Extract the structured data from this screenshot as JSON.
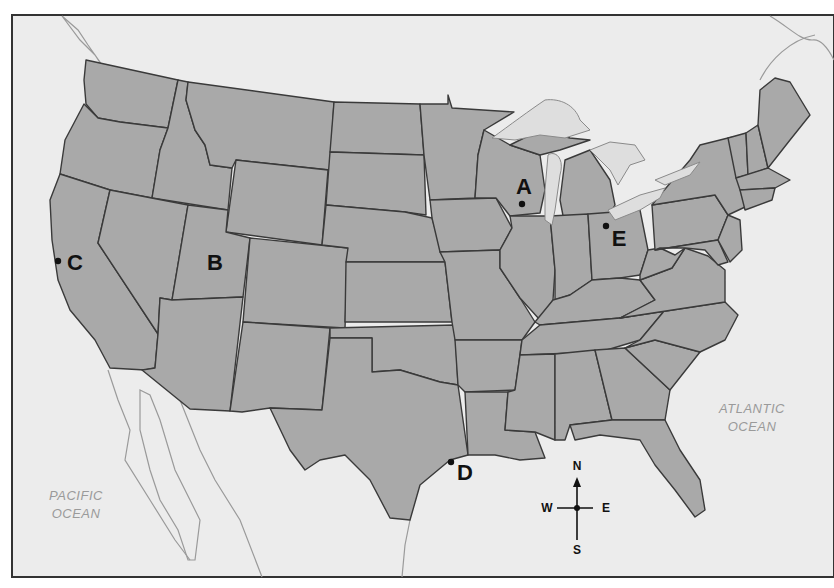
{
  "map": {
    "title": "United States",
    "colors": {
      "land": "#a9a9a9",
      "water": "#ececec",
      "border": "#3a3a3a",
      "frame": "#333333",
      "ocean_label": "#9a9a9a",
      "marker": "#111111"
    },
    "oceans": [
      {
        "line1": "PACIFIC",
        "line2": "OCEAN"
      },
      {
        "line1": "ATLANTIC",
        "line2": "OCEAN"
      }
    ],
    "markers": [
      {
        "label": "A",
        "place": "Wisconsin"
      },
      {
        "label": "B",
        "place": "Utah"
      },
      {
        "label": "C",
        "place": "California coast"
      },
      {
        "label": "D",
        "place": "Texas Gulf coast"
      },
      {
        "label": "E",
        "place": "Ohio"
      }
    ],
    "compass": {
      "north": "N",
      "south": "S",
      "east": "E",
      "west": "W"
    }
  }
}
